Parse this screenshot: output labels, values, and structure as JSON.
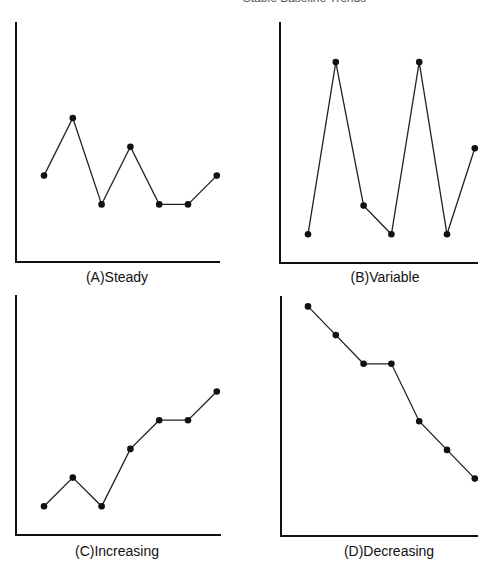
{
  "header": {
    "text": "Stable Baseline Trends"
  },
  "chart_data": [
    {
      "type": "line",
      "title": "(A) Steady",
      "x": [
        1,
        2,
        3,
        4,
        5,
        6,
        7
      ],
      "values": [
        3,
        5,
        2,
        4,
        2,
        2,
        3
      ],
      "xlabel": "",
      "ylabel": "",
      "ylim": [
        0,
        8.5
      ],
      "grid": false,
      "legend": "none"
    },
    {
      "type": "line",
      "title": "(B) Variable",
      "x": [
        1,
        2,
        3,
        4,
        5,
        6,
        7
      ],
      "values": [
        1,
        7,
        2,
        1,
        7,
        1,
        4
      ],
      "xlabel": "",
      "ylabel": "",
      "ylim": [
        0,
        8.5
      ],
      "grid": false,
      "legend": "none"
    },
    {
      "type": "line",
      "title": "(C) Increasing",
      "x": [
        1,
        2,
        3,
        4,
        5,
        6,
        7
      ],
      "values": [
        1,
        2,
        1,
        3,
        4,
        4,
        5
      ],
      "xlabel": "",
      "ylabel": "",
      "ylim": [
        0,
        8.5
      ],
      "grid": false,
      "legend": "none"
    },
    {
      "type": "line",
      "title": "(D) Decreasing",
      "x": [
        1,
        2,
        3,
        4,
        5,
        6,
        7
      ],
      "values": [
        8,
        7,
        6,
        6,
        4,
        3,
        2
      ],
      "xlabel": "",
      "ylabel": "",
      "ylim": [
        0,
        8.5
      ],
      "grid": false,
      "legend": "none"
    }
  ],
  "panels": [
    {
      "label": "(A)Steady"
    },
    {
      "label": "(B)Variable"
    },
    {
      "label": "(C)Increasing"
    },
    {
      "label": "(D)Decreasing"
    }
  ]
}
